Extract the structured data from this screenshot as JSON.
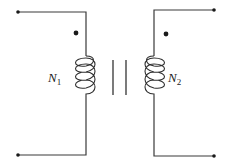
{
  "diagram": {
    "type": "transformer-schematic",
    "primary": {
      "label_main": "N",
      "label_sub": "1",
      "has_polarity_dot": true
    },
    "secondary": {
      "label_main": "N",
      "label_sub": "2",
      "has_polarity_dot": true
    },
    "core": {
      "type": "iron-core",
      "lines": 2
    },
    "terminals": 4,
    "colors": {
      "line": "#3a3a3a",
      "dot": "#1a1a1a",
      "background": "#ffffff"
    }
  }
}
